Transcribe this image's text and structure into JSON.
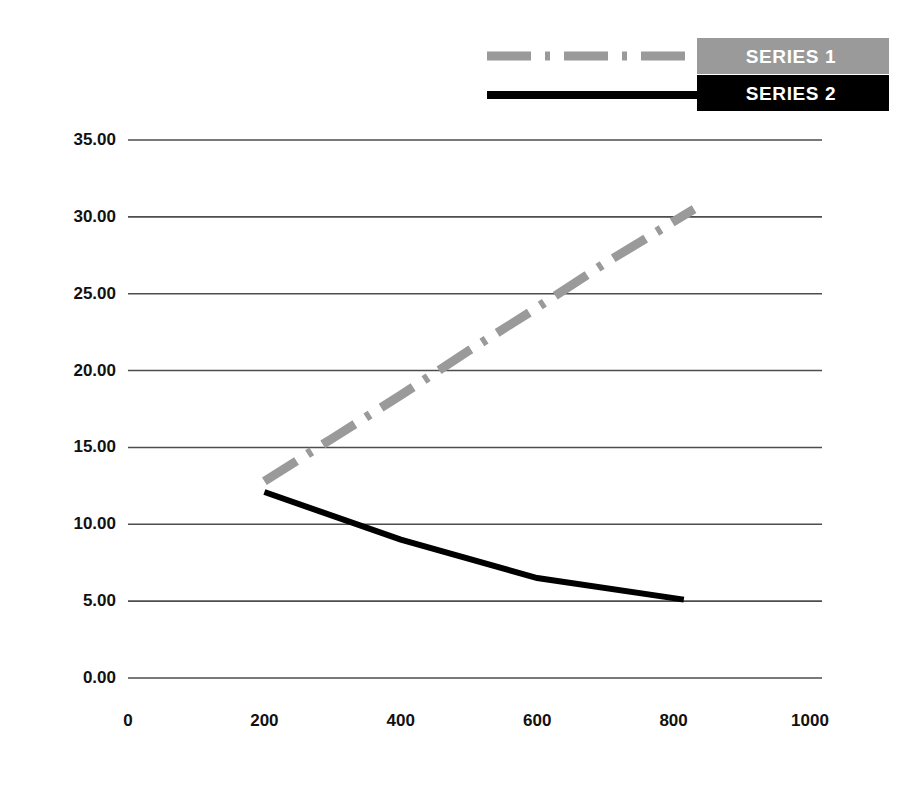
{
  "chart_data": {
    "type": "line",
    "title": "",
    "xlabel": "",
    "ylabel": "",
    "xlim": [
      0,
      1000
    ],
    "ylim": [
      0,
      35
    ],
    "grid": "horizontal",
    "legend_position": "top-right",
    "x_ticks": [
      "0",
      "200",
      "400",
      "600",
      "800",
      "1000"
    ],
    "x_tick_values": [
      0,
      200,
      400,
      600,
      800,
      1000
    ],
    "y_ticks": [
      "0.00",
      "5.00",
      "10.00",
      "15.00",
      "20.00",
      "25.00",
      "30.00",
      "35.00"
    ],
    "y_tick_values": [
      0,
      5,
      10,
      15,
      20,
      25,
      30,
      35
    ],
    "series": [
      {
        "name": "SERIES 1",
        "color": "#9a9a9a",
        "style": "dash-dot",
        "width": 9,
        "x": [
          200,
          300,
          400,
          500,
          600,
          700,
          830
        ],
        "values": [
          12.8,
          15.6,
          18.4,
          21.3,
          24.1,
          27.0,
          30.5
        ]
      },
      {
        "name": "SERIES 2",
        "color": "#000000",
        "style": "solid",
        "width": 6,
        "x": [
          200,
          400,
          600,
          815
        ],
        "values": [
          12.1,
          9.0,
          6.5,
          5.1
        ]
      }
    ]
  },
  "legend": {
    "items": [
      {
        "label": "SERIES 1",
        "box_color": "#9a9a9a",
        "text_color": "#ffffff",
        "line_color": "#9a9a9a",
        "line_style": "dash-dot"
      },
      {
        "label": "SERIES 2",
        "box_color": "#000000",
        "text_color": "#ffffff",
        "line_color": "#000000",
        "line_style": "solid"
      }
    ]
  },
  "axes": {
    "gridline_color": "#4d4d4d",
    "tick_label_color": "#111111"
  }
}
